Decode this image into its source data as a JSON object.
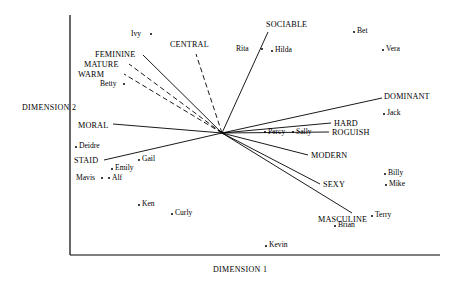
{
  "chart_data": {
    "type": "scatter",
    "title": "",
    "xlabel": "DIMENSION 1",
    "ylabel": "DIMENSION 2",
    "grid": false,
    "legend": "none",
    "origin": {
      "x": 222,
      "y": 133
    },
    "axes": {
      "x_axis": {
        "x1": 70,
        "y1": 255,
        "x2": 440,
        "y2": 255
      },
      "y_axis": {
        "x1": 70,
        "y1": 15,
        "x2": 70,
        "y2": 255
      }
    },
    "vectors": [
      {
        "name": "CENTRAL",
        "label": "CENTRAL",
        "tip_x": 196,
        "tip_y": 54,
        "style": "dashed",
        "label_x": 170,
        "label_y": 41,
        "anchor": "start"
      },
      {
        "name": "FEMININE",
        "label": "FEMININE",
        "tip_x": 143,
        "tip_y": 55,
        "style": "solid",
        "label_x": 95,
        "label_y": 51,
        "anchor": "start"
      },
      {
        "name": "MATURE",
        "label": "MATURE",
        "tip_x": 129,
        "tip_y": 64,
        "style": "dashed",
        "label_x": 84,
        "label_y": 61,
        "anchor": "start"
      },
      {
        "name": "WARM",
        "label": "WARM",
        "tip_x": 124,
        "tip_y": 74,
        "style": "dashed",
        "label_x": 78,
        "label_y": 71,
        "anchor": "start"
      },
      {
        "name": "SOCIABLE",
        "label": "SOCIABLE",
        "tip_x": 268,
        "tip_y": 32,
        "style": "solid",
        "label_x": 266,
        "label_y": 21,
        "anchor": "start"
      },
      {
        "name": "MORAL",
        "label": "MORAL",
        "tip_x": 113,
        "tip_y": 124,
        "style": "solid",
        "label_x": 78,
        "label_y": 122,
        "anchor": "start"
      },
      {
        "name": "DOMINANT",
        "label": "DOMINANT",
        "tip_x": 382,
        "tip_y": 98,
        "style": "solid",
        "label_x": 384,
        "label_y": 93,
        "anchor": "start"
      },
      {
        "name": "HARD",
        "label": "HARD",
        "tip_x": 331,
        "tip_y": 123,
        "style": "solid",
        "label_x": 334,
        "label_y": 120,
        "anchor": "start"
      },
      {
        "name": "ROGUISH",
        "label": "ROGUISH",
        "tip_x": 329,
        "tip_y": 132,
        "style": "solid",
        "label_x": 332,
        "label_y": 129,
        "anchor": "start"
      },
      {
        "name": "MODERN",
        "label": "MODERN",
        "tip_x": 308,
        "tip_y": 155,
        "style": "solid",
        "label_x": 311,
        "label_y": 152,
        "anchor": "start"
      },
      {
        "name": "SEXY",
        "label": "SEXY",
        "tip_x": 320,
        "tip_y": 184,
        "style": "solid",
        "label_x": 323,
        "label_y": 181,
        "anchor": "start"
      },
      {
        "name": "MASCULINE",
        "label": "MASCULINE",
        "tip_x": 352,
        "tip_y": 213,
        "style": "solid",
        "label_x": 318,
        "label_y": 216,
        "anchor": "start"
      },
      {
        "name": "STAID",
        "label": "STAID",
        "tip_x": 104,
        "tip_y": 160,
        "style": "solid",
        "label_x": 74,
        "label_y": 157,
        "anchor": "start"
      }
    ],
    "points": [
      {
        "name": "Ivy",
        "x": 150,
        "y": 33,
        "label_x": 131,
        "label_y": 30,
        "side": "left"
      },
      {
        "name": "Rita",
        "x": 261,
        "y": 48,
        "label_x": 236,
        "label_y": 45,
        "side": "left"
      },
      {
        "name": "Hilda",
        "x": 271,
        "y": 50,
        "label_x": 275,
        "label_y": 46,
        "side": "right"
      },
      {
        "name": "Bet",
        "x": 353,
        "y": 31,
        "label_x": 357,
        "label_y": 27,
        "side": "right"
      },
      {
        "name": "Vera",
        "x": 382,
        "y": 49,
        "label_x": 386,
        "label_y": 45,
        "side": "right"
      },
      {
        "name": "Jack",
        "x": 383,
        "y": 113,
        "label_x": 387,
        "label_y": 109,
        "side": "right"
      },
      {
        "name": "Betty",
        "x": 123,
        "y": 83,
        "label_x": 100,
        "label_y": 80,
        "side": "left"
      },
      {
        "name": "Percy",
        "x": 264,
        "y": 131,
        "label_x": 268,
        "label_y": 128,
        "side": "right"
      },
      {
        "name": "Sally",
        "x": 292,
        "y": 131,
        "label_x": 296,
        "label_y": 128,
        "side": "right"
      },
      {
        "name": "Deidre",
        "x": 75,
        "y": 146,
        "label_x": 79,
        "label_y": 142,
        "side": "right"
      },
      {
        "name": "Gail",
        "x": 138,
        "y": 159,
        "label_x": 142,
        "label_y": 155,
        "side": "right"
      },
      {
        "name": "Emily",
        "x": 111,
        "y": 168,
        "label_x": 115,
        "label_y": 164,
        "side": "right"
      },
      {
        "name": "Mavis",
        "x": 101,
        "y": 177,
        "label_x": 76,
        "label_y": 174,
        "side": "left"
      },
      {
        "name": "Alf",
        "x": 108,
        "y": 177,
        "label_x": 112,
        "label_y": 174,
        "side": "right"
      },
      {
        "name": "Billy",
        "x": 384,
        "y": 173,
        "label_x": 388,
        "label_y": 169,
        "side": "right"
      },
      {
        "name": "Mike",
        "x": 385,
        "y": 184,
        "label_x": 389,
        "label_y": 180,
        "side": "right"
      },
      {
        "name": "Ken",
        "x": 138,
        "y": 204,
        "label_x": 142,
        "label_y": 200,
        "side": "right"
      },
      {
        "name": "Curly",
        "x": 171,
        "y": 213,
        "label_x": 175,
        "label_y": 209,
        "side": "right"
      },
      {
        "name": "Terry",
        "x": 371,
        "y": 215,
        "label_x": 375,
        "label_y": 211,
        "side": "right"
      },
      {
        "name": "Brian",
        "x": 334,
        "y": 225,
        "label_x": 338,
        "label_y": 221,
        "side": "right"
      },
      {
        "name": "Kevin",
        "x": 265,
        "y": 245,
        "label_x": 269,
        "label_y": 241,
        "side": "right"
      }
    ]
  },
  "axis_labels": {
    "x": "DIMENSION 1",
    "y": "DIMENSION 2",
    "x_label_pos": {
      "x": 213,
      "y": 266
    },
    "y_label_pos": {
      "x": 22,
      "y": 104
    }
  },
  "colors": {
    "line": "#000000",
    "text": "#000000",
    "background": "#ffffff"
  }
}
